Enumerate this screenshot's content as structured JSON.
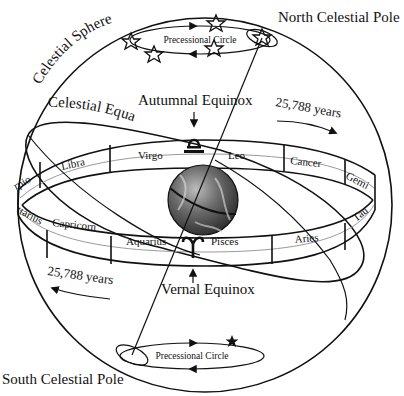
{
  "diagram": {
    "labels": {
      "north_pole": "North Celestial Pole",
      "south_pole": "South Celestial Pole",
      "celestial_sphere": "Celestial Sphere",
      "celestial_equator": "Celestial Equator",
      "autumnal_equinox": "Autumnal Equinox",
      "vernal_equinox": "Vernal Equinox",
      "period_top": "25,788 years",
      "period_bottom": "25,788 years",
      "precessional_circle_top": "Precessional Circle",
      "precessional_circle_bottom": "Precessional Circle"
    },
    "zodiac_back": [
      "Libra",
      "Virgo",
      "Leo",
      "Cancer"
    ],
    "zodiac_front": [
      "Capricorn",
      "Aquarius",
      "Pisces",
      "Aries"
    ],
    "zodiac_edge": {
      "left_top": "rpio",
      "left_bottom": "ttarius",
      "right_top": "Gemi",
      "right_bottom": "Tau"
    },
    "symbols": {
      "autumnal": "libra-glyph",
      "vernal": "aries-glyph"
    },
    "colors": {
      "ink": "#111111",
      "guide_line": "#9a9a9a",
      "background": "#ffffff",
      "earth": "#555555"
    }
  }
}
